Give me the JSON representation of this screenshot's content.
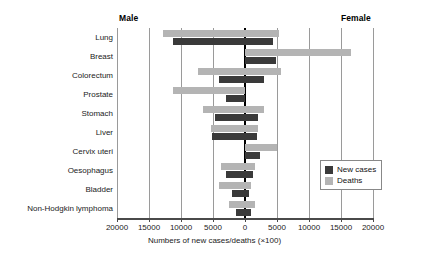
{
  "headers": {
    "left": "Male",
    "right": "Female"
  },
  "legend": {
    "cases_label": "New cases",
    "deaths_label": "Deaths",
    "cases_color": "#3a3a3a",
    "deaths_color": "#b4b4b4"
  },
  "axis": {
    "title": "Numbers of new cases/deaths (×100)",
    "ticklabels": [
      "20000",
      "15000",
      "10000",
      "5000",
      "0",
      "5000",
      "10000",
      "15000",
      "20000"
    ]
  },
  "chart_data": {
    "type": "bar",
    "orientation": "horizontal-diverging",
    "title": "",
    "xlabel": "Numbers of new cases/deaths (×100)",
    "ylabel": "",
    "xlim": [
      -20000,
      20000
    ],
    "grid": true,
    "legend_position": "right-inside",
    "left_group": "Male",
    "right_group": "Female",
    "xticks": [
      -20000,
      -15000,
      -10000,
      -5000,
      0,
      5000,
      10000,
      15000,
      20000
    ],
    "xticklabels": [
      "20000",
      "15000",
      "10000",
      "5000",
      "0",
      "5000",
      "10000",
      "15000",
      "20000"
    ],
    "categories": [
      "Lung",
      "Breast",
      "Colorectum",
      "Prostate",
      "Stomach",
      "Liver",
      "Cervix uteri",
      "Oesophagus",
      "Bladder",
      "Non-Hodgkin lymphoma"
    ],
    "series": [
      {
        "name": "New cases",
        "color": "#3a3a3a",
        "male": [
          11300,
          0,
          4100,
          3000,
          4700,
          5100,
          0,
          3000,
          2000,
          1400
        ],
        "female": [
          4400,
          4900,
          2900,
          0,
          2000,
          1900,
          2400,
          1200,
          700,
          1000
        ]
      },
      {
        "name": "Deaths",
        "color": "#b4b4b4",
        "male": [
          12800,
          0,
          7400,
          11200,
          6500,
          5300,
          0,
          3700,
          4000,
          2500
        ],
        "female": [
          5300,
          16500,
          5700,
          0,
          2900,
          2000,
          5000,
          1500,
          1000,
          1600
        ]
      }
    ],
    "units": "hundreds"
  }
}
